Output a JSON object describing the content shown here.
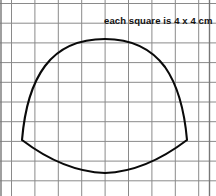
{
  "page": {
    "width": 216,
    "height": 196,
    "background_color": "#ffffff"
  },
  "caption": {
    "text": "each square is 4 x 4 cm"
  },
  "grid": {
    "line_color": "#8a8a8a",
    "line_width": 1,
    "border_color": "#777777",
    "cell_width_px": 23.4,
    "cell_height_px": 19.7,
    "cell_label": "4 x 4 cm",
    "x_lines": [
      11.5,
      34.9,
      58.3,
      81.7,
      105.1,
      128.5,
      151.9,
      175.3,
      198.7
    ],
    "y_lines": [
      3.5,
      23.2,
      42.9,
      62.6,
      82.3,
      102.0,
      121.7,
      141.4,
      161.1,
      180.8
    ],
    "frame": {
      "left": 1.0,
      "top": 1.0,
      "right": 209.5,
      "bottom": 194.0
    }
  },
  "figure": {
    "name": "bell-shaped-outline",
    "stroke_color": "#0a0a0a",
    "stroke_width": 2.1,
    "fill": "none",
    "key_points": {
      "apex_x": 105,
      "apex_y": 40,
      "left_corner_x": 22,
      "left_corner_y": 140,
      "right_corner_x": 187,
      "right_corner_y": 140,
      "bottom_low_x": 105,
      "bottom_low_y": 173
    },
    "path": "M 22 140 C 24 116 30 86 45 66 C 60 46 82 39 105 39 C 128 39 150 47 165 67 C 179 87 185 117 187 140 C 162 159 134 172 105 173 C 76 172 47 159 22 140 Z"
  }
}
